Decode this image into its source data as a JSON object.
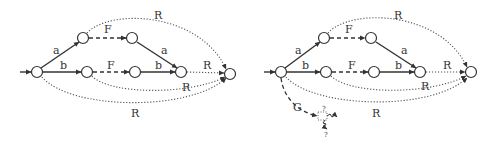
{
  "diagrams": [
    {
      "id": "left",
      "edges": {
        "start_to_upper": "a",
        "upper_F": "F",
        "upper_to_merge": "a",
        "start_to_lower": "b",
        "lower_F": "F",
        "lower_to_merge": "b",
        "merge_to_final": "R",
        "top_arc": "R",
        "lower_arc": "R",
        "bottom_arc": "R"
      }
    },
    {
      "id": "right",
      "edges": {
        "start_to_upper": "a",
        "upper_F": "F",
        "upper_to_merge": "a",
        "start_to_lower": "b",
        "lower_F": "F",
        "lower_to_merge": "b",
        "merge_to_final": "R",
        "top_arc": "R",
        "lower_arc": "R",
        "bottom_arc": "R",
        "g_edge": "G",
        "q1": "?",
        "q2": "?"
      }
    }
  ]
}
